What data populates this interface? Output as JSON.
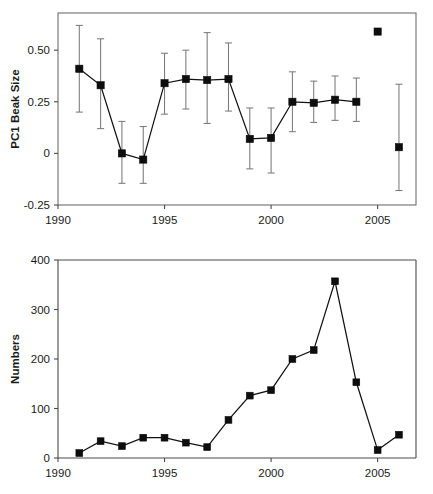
{
  "figure": {
    "background": "#ffffff",
    "marker_color": "#0d0d0d",
    "line_color": "#111111",
    "errorbar_color": "#7a7a7a",
    "axis_color": "#4a4a4a"
  },
  "chart_data": [
    {
      "type": "line",
      "panel": "top",
      "title": "",
      "xlabel": "",
      "ylabel": "PC1 Beak Size",
      "xlim": [
        1990,
        2006.8
      ],
      "ylim": [
        -0.25,
        0.68
      ],
      "xticks": [
        1990,
        1995,
        2000,
        2005
      ],
      "xticklabels": [
        "1990",
        "1995",
        "2000",
        "2005"
      ],
      "yticks": [
        -0.25,
        0,
        0.25,
        0.5
      ],
      "yticklabels": [
        "-0.25",
        "0",
        "0.25",
        "0.50"
      ],
      "grid": false,
      "legend": "none",
      "x": [
        1991,
        1992,
        1993,
        1994,
        1995,
        1996,
        1997,
        1998,
        1999,
        2000,
        2001,
        2002,
        2003,
        2004
      ],
      "values": [
        0.41,
        0.33,
        0.0,
        -0.03,
        0.34,
        0.36,
        0.355,
        0.36,
        0.07,
        0.075,
        0.25,
        0.245,
        0.26,
        0.25
      ],
      "err_low": [
        0.2,
        0.12,
        -0.145,
        -0.145,
        0.19,
        0.215,
        0.145,
        0.205,
        -0.075,
        -0.095,
        0.105,
        0.15,
        0.16,
        0.155
      ],
      "err_high": [
        0.62,
        0.555,
        0.155,
        0.13,
        0.485,
        0.5,
        0.585,
        0.535,
        0.22,
        0.22,
        0.395,
        0.35,
        0.375,
        0.365
      ],
      "unconnected_points": [
        {
          "x": 2005,
          "y": 0.59,
          "has_errorbar": false
        },
        {
          "x": 2006,
          "y": 0.03,
          "has_errorbar": true,
          "err_low": -0.18,
          "err_high": 0.335
        }
      ]
    },
    {
      "type": "line",
      "panel": "bottom",
      "title": "",
      "xlabel": "",
      "ylabel": "Numbers",
      "xlim": [
        1990,
        2006.8
      ],
      "ylim": [
        0,
        400
      ],
      "xticks": [
        1990,
        1995,
        2000,
        2005
      ],
      "xticklabels": [
        "1990",
        "1995",
        "2000",
        "2005"
      ],
      "yticks": [
        0,
        100,
        200,
        300,
        400
      ],
      "yticklabels": [
        "0",
        "100",
        "200",
        "300",
        "400"
      ],
      "grid": false,
      "legend": "none",
      "x": [
        1991,
        1992,
        1993,
        1994,
        1995,
        1996,
        1997,
        1998,
        1999,
        2000,
        2001,
        2002,
        2003,
        2004,
        2005,
        2006
      ],
      "values": [
        10,
        34,
        24,
        41,
        41,
        31,
        22,
        77,
        126,
        137,
        200,
        218,
        357,
        153,
        16,
        47
      ]
    }
  ]
}
